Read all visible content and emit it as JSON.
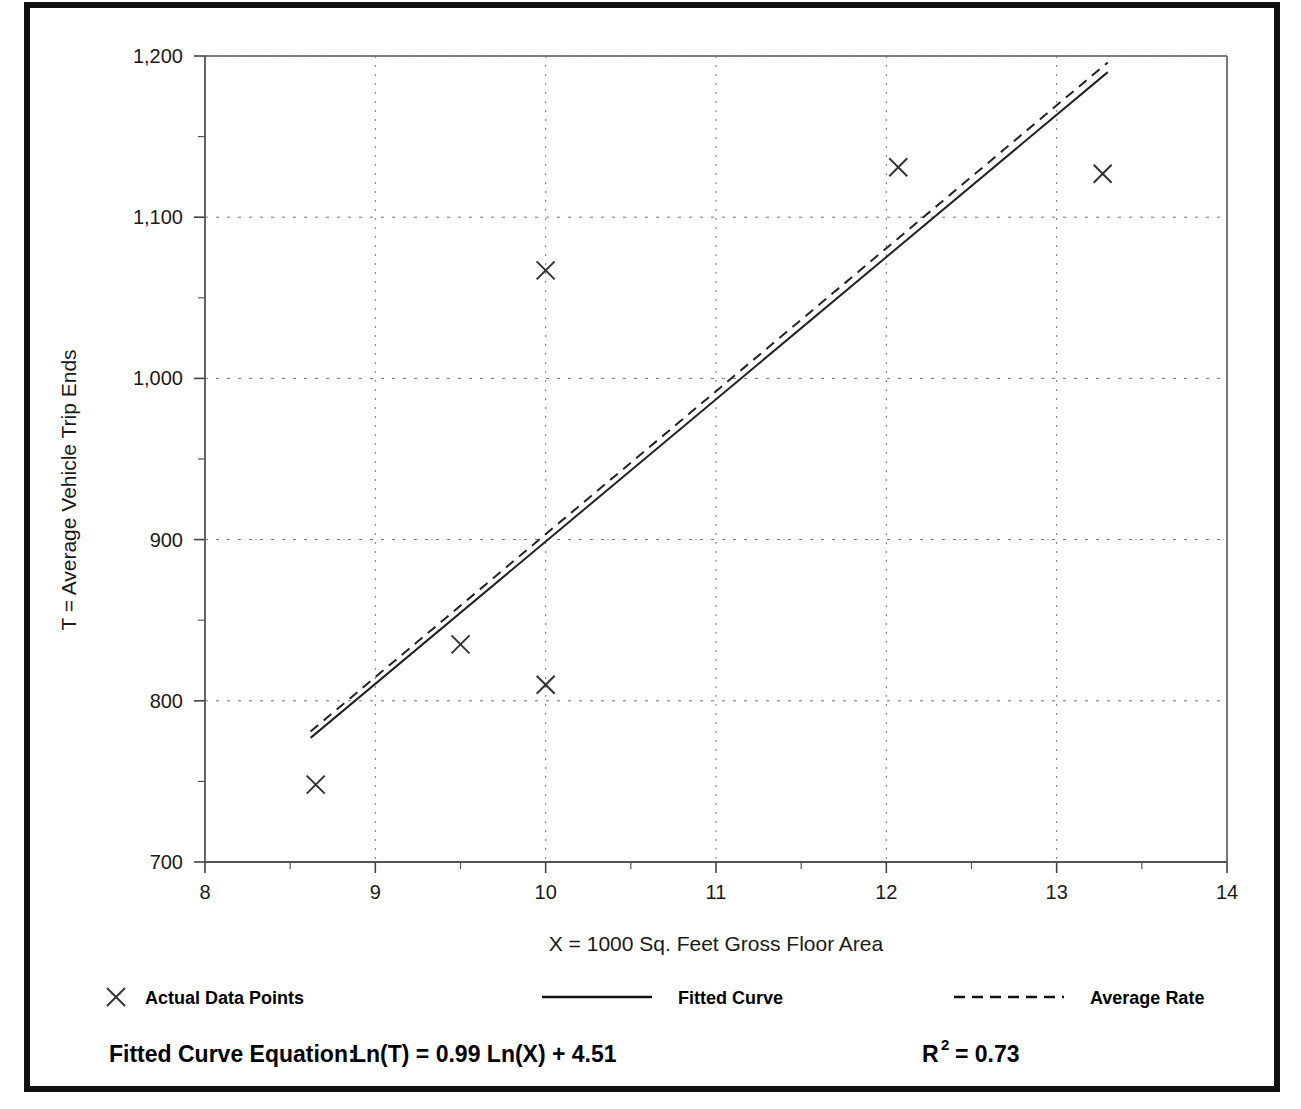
{
  "chart_data": {
    "type": "scatter",
    "title": "",
    "xlabel": "X = 1000 Sq. Feet Gross Floor Area",
    "ylabel": "T = Average Vehicle Trip Ends",
    "xlim": [
      8,
      14
    ],
    "ylim": [
      700,
      1200
    ],
    "x_ticks": [
      "8",
      "9",
      "10",
      "11",
      "12",
      "13",
      "14"
    ],
    "x_tick_values": [
      8,
      9,
      10,
      11,
      12,
      13,
      14
    ],
    "x_minor_tick_values": [
      8.5,
      9.5,
      10.5,
      11.5,
      12.5,
      13.5
    ],
    "y_ticks": [
      "700",
      "800",
      "900",
      "1,000",
      "1,100",
      "1,200"
    ],
    "y_tick_values": [
      700,
      800,
      900,
      1000,
      1100,
      1200
    ],
    "y_minor_tick_values": [
      750,
      850,
      950,
      1050,
      1150
    ],
    "grid": "dotted",
    "legend_position": "below-axis",
    "series": [
      {
        "name": "Actual Data Points",
        "type": "scatter",
        "marker": "x",
        "points": [
          {
            "x": 8.65,
            "y": 748
          },
          {
            "x": 9.5,
            "y": 835
          },
          {
            "x": 10.0,
            "y": 810
          },
          {
            "x": 10.0,
            "y": 1067
          },
          {
            "x": 12.07,
            "y": 1131
          },
          {
            "x": 13.27,
            "y": 1127
          }
        ]
      },
      {
        "name": "Fitted Curve",
        "type": "line",
        "style": "solid",
        "points": [
          {
            "x": 8.62,
            "y": 777
          },
          {
            "x": 13.3,
            "y": 1190
          }
        ]
      },
      {
        "name": "Average Rate",
        "type": "line",
        "style": "dashed",
        "points": [
          {
            "x": 8.62,
            "y": 781
          },
          {
            "x": 13.3,
            "y": 1196
          }
        ]
      }
    ]
  },
  "legend": {
    "items": [
      {
        "label": "Actual Data Points",
        "marker": "x-marker"
      },
      {
        "label": "Fitted Curve",
        "marker": "solid-line"
      },
      {
        "label": "Average Rate",
        "marker": "dashed-line"
      }
    ]
  },
  "footer": {
    "equation_label": "Fitted Curve Equation:",
    "equation": "Ln(T) = 0.99 Ln(X) + 4.51",
    "r_squared_base": "R",
    "r_squared_exponent": "2",
    "r_squared_value": "= 0.73"
  },
  "colors": {
    "frame": "#111111",
    "axis": "#444444",
    "grid": "#777777",
    "marker": "#333333",
    "text": "#000000"
  }
}
